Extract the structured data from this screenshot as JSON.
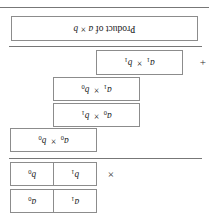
{
  "figure": {
    "orientation": "rotated-180",
    "product_row": {
      "label": "Product of a × b"
    },
    "partial_products": [
      {
        "name": "a1-times-b1",
        "label": "a₁ × b₁"
      },
      {
        "name": "a1-times-b0",
        "label": "a₁ × b₀"
      },
      {
        "name": "a0-times-b1",
        "label": "a₀ × b₁"
      },
      {
        "name": "a0-times-b0",
        "label": "a₀ × b₀"
      }
    ],
    "operators": {
      "plus": "+",
      "times": "×"
    },
    "operand_a": {
      "high_digit": "a₁",
      "low_digit": "a₀"
    },
    "operand_b": {
      "high_digit": "b₁",
      "low_digit": "b₀"
    },
    "colors": {
      "box_border": "#8c8c8c",
      "rule": "#777777",
      "text": "#1a1a1a",
      "background": "#ffffff"
    }
  }
}
